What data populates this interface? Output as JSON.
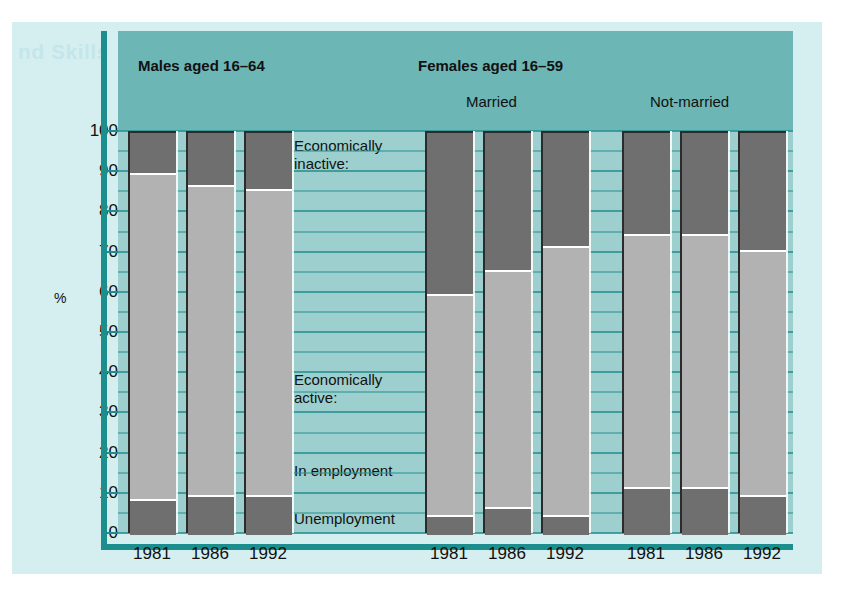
{
  "figure": {
    "ghost_text": "nd Skills",
    "y_axis_label": "%",
    "y_ticks": [
      "100",
      "90",
      "80",
      "70",
      "60",
      "50",
      "40",
      "30",
      "20",
      "10",
      "0"
    ],
    "groups": [
      {
        "title": "Males aged 16–64",
        "subtitle": ""
      },
      {
        "title": "Females aged 16–59",
        "subtitle_left": "Married",
        "subtitle_right": "Not-married"
      }
    ],
    "legend": {
      "inactive_line1": "Economically",
      "inactive_line2": "inactive:",
      "active_line1": "Economically",
      "active_line2": "active:",
      "in_employment": "In employment",
      "unemployment": "Unemployment"
    },
    "x_labels": [
      "1981",
      "1986",
      "1992",
      "1981",
      "1986",
      "1992",
      "1981",
      "1986",
      "1992"
    ],
    "colors": {
      "band": "#6cb6b6",
      "plot_bg": "#9ccfce",
      "paper": "#d5eff0",
      "rule": "#1c8e8e",
      "gridline": "#2f9494",
      "inactive": "#6f6f6f",
      "employed": "#b2b2b2",
      "unemployed": "#6f6f6f"
    }
  },
  "chart_data": {
    "type": "bar",
    "subtype": "stacked-100-percent",
    "title": "",
    "xlabel": "",
    "ylabel": "%",
    "ylim": [
      0,
      100
    ],
    "yticks": [
      0,
      10,
      20,
      30,
      40,
      50,
      60,
      70,
      80,
      90,
      100
    ],
    "grid": true,
    "legend_position": "inside-center",
    "categories": [
      "1981",
      "1986",
      "1992",
      "1981",
      "1986",
      "1992",
      "1981",
      "1986",
      "1992"
    ],
    "group_labels": [
      "Males aged 16–64",
      "Males aged 16–64",
      "Males aged 16–64",
      "Females aged 16–59 Married",
      "Females aged 16–59 Married",
      "Females aged 16–59 Married",
      "Females aged 16–59 Not-married",
      "Females aged 16–59 Not-married",
      "Females aged 16–59 Not-married"
    ],
    "series": [
      {
        "name": "Unemployment",
        "values": [
          9,
          10,
          10,
          5,
          7,
          5,
          12,
          12,
          10
        ]
      },
      {
        "name": "In employment",
        "values": [
          81,
          77,
          76,
          55,
          59,
          67,
          63,
          63,
          61
        ]
      },
      {
        "name": "Economically inactive",
        "values": [
          10,
          13,
          14,
          40,
          34,
          28,
          25,
          25,
          29
        ]
      }
    ],
    "bars": [
      {
        "group": "Males aged 16-64",
        "year": "1981",
        "unemployment": 9,
        "in_employment": 81,
        "economically_inactive": 10,
        "economically_active": 90
      },
      {
        "group": "Males aged 16-64",
        "year": "1986",
        "unemployment": 10,
        "in_employment": 77,
        "economically_inactive": 13,
        "economically_active": 87
      },
      {
        "group": "Males aged 16-64",
        "year": "1992",
        "unemployment": 10,
        "in_employment": 76,
        "economically_inactive": 14,
        "economically_active": 86
      },
      {
        "group": "Females 16-59 Married",
        "year": "1981",
        "unemployment": 5,
        "in_employment": 55,
        "economically_inactive": 40,
        "economically_active": 60
      },
      {
        "group": "Females 16-59 Married",
        "year": "1986",
        "unemployment": 7,
        "in_employment": 59,
        "economically_inactive": 34,
        "economically_active": 66
      },
      {
        "group": "Females 16-59 Married",
        "year": "1992",
        "unemployment": 5,
        "in_employment": 67,
        "economically_inactive": 28,
        "economically_active": 72
      },
      {
        "group": "Females 16-59 Not-married",
        "year": "1981",
        "unemployment": 12,
        "in_employment": 63,
        "economically_inactive": 25,
        "economically_active": 75
      },
      {
        "group": "Females 16-59 Not-married",
        "year": "1986",
        "unemployment": 12,
        "in_employment": 63,
        "economically_inactive": 25,
        "economically_active": 75
      },
      {
        "group": "Females 16-59 Not-married",
        "year": "1992",
        "unemployment": 10,
        "in_employment": 61,
        "economically_inactive": 29,
        "economically_active": 71
      }
    ]
  }
}
